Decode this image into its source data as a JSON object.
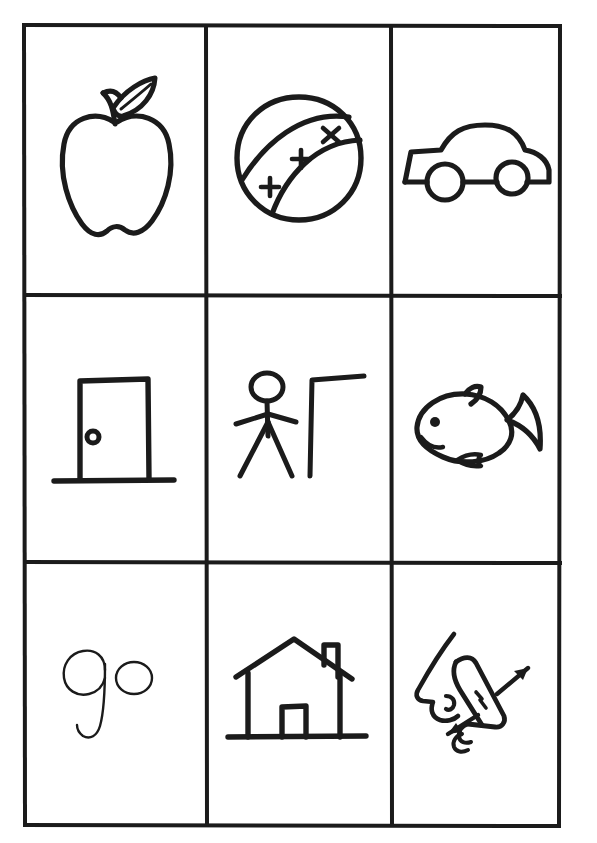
{
  "page": {
    "background_color": "#ffffff",
    "ink_color": "#1b1b1b",
    "columns": 3,
    "rows": 3
  },
  "grid": {
    "border_color": "#1b1b1b",
    "border_width_px": 4,
    "divider_width_px": 4,
    "outer_left_px": 22,
    "outer_top_px": 23,
    "outer_width_px": 540,
    "outer_height_px": 805,
    "column_divider_x": [
      184,
      369
    ],
    "row_divider_y": [
      272,
      539
    ]
  },
  "cells": [
    {
      "index": 0,
      "row": 0,
      "column": 0,
      "icon": "apple-icon",
      "label": "apple",
      "description": "Hand-drawn outline of an apple with a curved stem and a single leaf pointing up to the right."
    },
    {
      "index": 1,
      "row": 0,
      "column": 1,
      "icon": "ball-icon",
      "label": "ball",
      "description": "Hand-drawn round ball with a diagonal band across it marked by three small cross marks.",
      "marks": [
        "+",
        "+",
        "x"
      ],
      "mark_count": 3
    },
    {
      "index": 2,
      "row": 0,
      "column": 2,
      "icon": "car-icon",
      "label": "car",
      "description": "Hand-drawn side profile of a car with two round wheels."
    },
    {
      "index": 3,
      "row": 1,
      "column": 0,
      "icon": "door-icon",
      "label": "door",
      "description": "Hand-drawn rectangular door with a round knob on the left side, resting on a floor line."
    },
    {
      "index": 4,
      "row": 1,
      "column": 1,
      "icon": "person-and-pole-icon",
      "label": "person next to pole",
      "description": "Hand-drawn stick figure with a round head, arms out and legs apart, standing beside a tall gamma-shaped pole or bar."
    },
    {
      "index": 5,
      "row": 1,
      "column": 2,
      "icon": "fish-icon",
      "label": "fish",
      "description": "Hand-drawn fish facing left with a dot eye, curved mouth, dorsal fin, belly fin and a forked tail."
    },
    {
      "index": 6,
      "row": 2,
      "column": 0,
      "icon": "handwritten-text",
      "label": "go",
      "text": "go",
      "description": "The word go written by hand in lowercase script."
    },
    {
      "index": 7,
      "row": 2,
      "column": 1,
      "icon": "house-icon",
      "label": "house",
      "description": "Hand-drawn house with a pitched roof, a chimney on the right, a door and a ground line."
    },
    {
      "index": 8,
      "row": 2,
      "column": 2,
      "icon": "pointing-hand-and-face-icon",
      "label": "pointing hand at face",
      "description": "Hand-drawn side profile of a face with nose and lips beside a hand with the index finger pointing up and to the right, with two motion arrows.",
      "arrows": [
        "up-right-arrow",
        "down-left-arrow"
      ],
      "arrow_count": 2
    }
  ]
}
